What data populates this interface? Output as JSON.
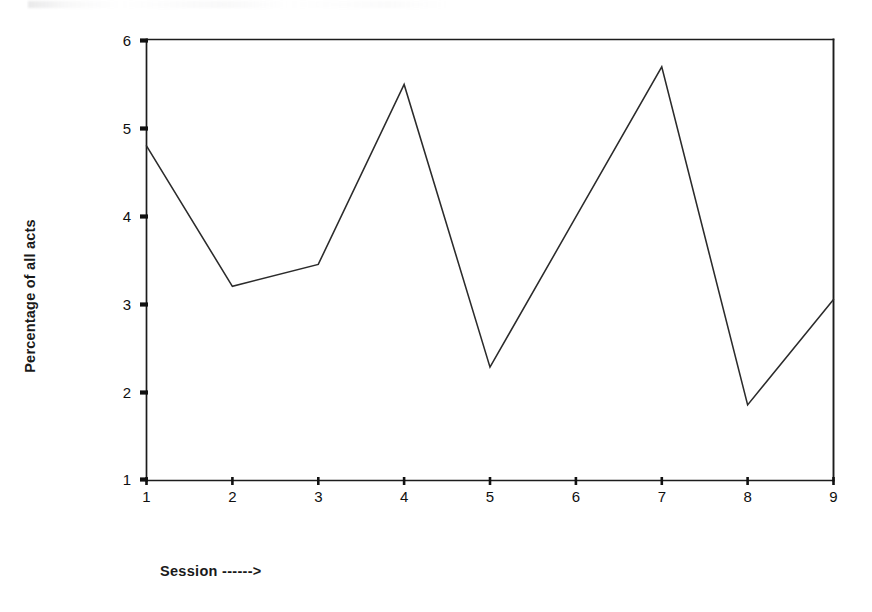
{
  "chart_data": {
    "type": "line",
    "title": "",
    "subtitle": "",
    "xlabel": "Session ------>",
    "ylabel": "Percentage of all acts",
    "xlim": [
      1,
      9
    ],
    "ylim": [
      1,
      6
    ],
    "xticks": [
      "1",
      "2",
      "3",
      "4",
      "5",
      "6",
      "7",
      "8",
      "9"
    ],
    "yticks": [
      "1",
      "2",
      "3",
      "4",
      "5",
      "6"
    ],
    "grid": false,
    "legend": null,
    "x": [
      1,
      2,
      3,
      4,
      5,
      6,
      7,
      8,
      9
    ],
    "values": [
      4.8,
      3.2,
      3.45,
      5.5,
      2.28,
      3.99,
      5.7,
      1.85,
      3.05
    ],
    "series": [
      {
        "name": "Percentage of all acts",
        "values": [
          4.8,
          3.2,
          3.45,
          5.5,
          2.28,
          3.99,
          5.7,
          1.85,
          3.05
        ]
      }
    ],
    "line_color": "#2b2b2b",
    "axis_color": "#1a1a1a",
    "background_color": "#ffffff",
    "markers": false,
    "frame": "box"
  },
  "axes": {
    "ylabel_text": "Percentage of all acts",
    "xlabel_text": "Session ------>"
  }
}
